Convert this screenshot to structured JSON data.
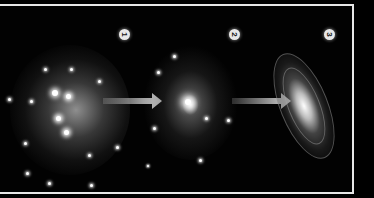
{
  "diagram": {
    "stages": [
      {
        "label": "1",
        "description": "diffuse protogalactic cloud of stars"
      },
      {
        "label": "2",
        "description": "collapsing star cluster with bright core"
      },
      {
        "label": "3",
        "description": "spiral galaxy"
      }
    ],
    "arrows": [
      {
        "from": "1",
        "to": "2"
      },
      {
        "from": "2",
        "to": "3"
      }
    ],
    "colors": {
      "background": "#000000",
      "frame": "#e6e6e6",
      "arrow": "#bdbdbd",
      "badge": "#e8e8e8"
    }
  }
}
